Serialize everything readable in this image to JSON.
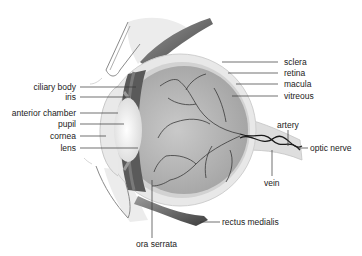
{
  "diagram": {
    "labels_left": [
      {
        "id": "ciliary-body",
        "text": "ciliary body",
        "x": 88,
        "y": 87
      },
      {
        "id": "iris",
        "text": "iris",
        "x": 88,
        "y": 97
      },
      {
        "id": "anterior-chamber",
        "text": "anterior chamber",
        "x": 78,
        "y": 113
      },
      {
        "id": "pupil",
        "text": "pupil",
        "x": 78,
        "y": 124
      },
      {
        "id": "cornea",
        "text": "cornea",
        "x": 78,
        "y": 136
      },
      {
        "id": "lens",
        "text": "lens",
        "x": 78,
        "y": 148
      }
    ],
    "labels_right": [
      {
        "id": "sclera",
        "text": "sclera",
        "x": 284,
        "y": 62
      },
      {
        "id": "retina",
        "text": "retina",
        "x": 284,
        "y": 73
      },
      {
        "id": "macula",
        "text": "macula",
        "x": 284,
        "y": 84
      },
      {
        "id": "vitreous",
        "text": "vitreous",
        "x": 284,
        "y": 96
      }
    ],
    "labels_other": [
      {
        "id": "artery",
        "text": "artery",
        "x": 279,
        "y": 120
      },
      {
        "id": "optic-nerve",
        "text": "optic nerve",
        "x": 310,
        "y": 143
      },
      {
        "id": "vein",
        "text": "vein",
        "x": 265,
        "y": 178
      },
      {
        "id": "rectus-medialis",
        "text": "rectus medialis",
        "x": 222,
        "y": 217
      },
      {
        "id": "ora-serrata",
        "text": "ora serrata",
        "x": 136,
        "y": 239
      }
    ],
    "colors": {
      "sclera": "#e6e6e6",
      "vitreous": "#b8b8b8",
      "vessels": "#3a3a3a",
      "muscle": "#555555",
      "lens": "#f4f4f4",
      "leader": "#333333"
    }
  }
}
